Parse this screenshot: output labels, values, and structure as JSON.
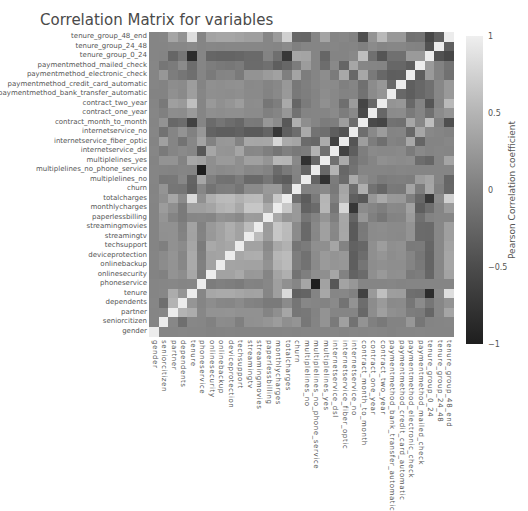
{
  "chart_data": {
    "type": "heatmap",
    "title": "Correlation Matrix for variables",
    "xlabel": "",
    "ylabel": "",
    "colorbar": {
      "label": "Pearson Correlation coefficient",
      "ticks": [
        "1",
        "0.5",
        "0",
        "−0.5",
        "−1"
      ],
      "range": [
        -1,
        1
      ],
      "colormap": "grayscale (light = +1, dark = -1)"
    },
    "grid": false,
    "legend_position": "right",
    "variables": [
      "gender",
      "seniorcitizen",
      "partner",
      "dependents",
      "tenure",
      "phoneservice",
      "onlinesecurity",
      "onlinebackup",
      "deviceprotection",
      "techsupport",
      "streamingtv",
      "streamingmovies",
      "paperlessbilling",
      "monthlycharges",
      "totalcharges",
      "churn",
      "multiplelines_no",
      "multiplelines_no_phone_service",
      "multiplelines_yes",
      "internetservice_dsl",
      "internetservice_fiber_optic",
      "internetservice_no",
      "contract_month_to_month",
      "contract_one_year",
      "contract_two_year",
      "paymentmethod_bank_transfer_automatic",
      "paymentmethod_credit_card_automatic",
      "paymentmethod_electronic_check",
      "paymentmethod_mailed_check",
      "tenure_group_0_24",
      "tenure_group_24_48",
      "tenure_group_48_end"
    ],
    "x_tick_labels_order": "left-to-right, same as variables",
    "y_tick_labels_order": "bottom-to-top, same as variables",
    "matrix_note": "Approximate values estimated from grayscale shading; diagonal = 1",
    "values": [
      [
        1,
        0,
        0,
        0.01,
        0,
        0,
        -0.02,
        -0.01,
        0,
        -0.01,
        -0.01,
        -0.01,
        -0.01,
        -0.01,
        0,
        -0.01,
        0,
        0,
        -0.01,
        0.01,
        -0.01,
        0.01,
        0,
        0.01,
        0,
        -0.02,
        0,
        0,
        0.01,
        0,
        0,
        0
      ],
      [
        0,
        1,
        0.02,
        -0.21,
        0.02,
        0.01,
        -0.04,
        0.07,
        0.06,
        -0.06,
        0.11,
        0.12,
        0.16,
        0.22,
        0.1,
        0.15,
        -0.14,
        -0.01,
        0.14,
        -0.11,
        0.26,
        -0.18,
        0.14,
        -0.05,
        -0.12,
        -0.02,
        -0.02,
        0.17,
        -0.15,
        -0.01,
        0,
        0.01
      ],
      [
        0,
        0.02,
        1,
        0.45,
        0.38,
        0.02,
        0.14,
        0.14,
        0.15,
        0.12,
        0.12,
        0.12,
        -0.01,
        0.1,
        0.32,
        -0.15,
        -0.13,
        -0.02,
        0.14,
        0,
        0,
        0,
        -0.28,
        0.08,
        0.25,
        0.11,
        0.08,
        -0.08,
        -0.1,
        -0.3,
        0.02,
        0.31
      ],
      [
        0.01,
        -0.21,
        0.45,
        1,
        0.16,
        0,
        0.08,
        0.02,
        0.01,
        0.06,
        -0.02,
        -0.04,
        -0.11,
        -0.11,
        0.06,
        -0.16,
        0.02,
        0,
        -0.02,
        0.05,
        -0.17,
        0.14,
        -0.23,
        0.07,
        0.2,
        0.05,
        0.06,
        -0.15,
        0.06,
        -0.15,
        0.02,
        0.14
      ],
      [
        0,
        0.02,
        0.38,
        0.16,
        1,
        0.01,
        0.33,
        0.36,
        0.36,
        0.32,
        0.28,
        0.29,
        0.01,
        0.25,
        0.83,
        -0.35,
        -0.32,
        -0.01,
        0.33,
        0.01,
        0.02,
        -0.04,
        -0.65,
        0.2,
        0.56,
        0.24,
        0.23,
        -0.21,
        -0.23,
        -0.86,
        0.05,
        0.86
      ],
      [
        0,
        0.01,
        0.02,
        0,
        0.01,
        1,
        -0.09,
        -0.05,
        -0.07,
        -0.1,
        -0.02,
        -0.03,
        0.02,
        0.25,
        0.11,
        0.01,
        0.32,
        -1,
        0.28,
        -0.45,
        0.29,
        0.17,
        0,
        0,
        0,
        0.01,
        -0.01,
        0,
        0,
        0,
        0,
        0
      ],
      [
        -0.02,
        -0.04,
        0.14,
        0.08,
        0.33,
        -0.09,
        1,
        0.28,
        0.28,
        0.35,
        0.18,
        0.19,
        0,
        0.3,
        0.41,
        -0.17,
        -0.06,
        0.09,
        0.1,
        0.32,
        -0.03,
        -0.33,
        -0.25,
        0.1,
        0.19,
        0.1,
        0.11,
        -0.11,
        -0.08,
        -0.3,
        0.02,
        0.29
      ],
      [
        -0.01,
        0.07,
        0.14,
        0.02,
        0.36,
        -0.05,
        0.28,
        1,
        0.3,
        0.29,
        0.28,
        0.28,
        0.13,
        0.44,
        0.51,
        -0.08,
        -0.18,
        0.05,
        0.2,
        0.16,
        0.17,
        -0.38,
        -0.16,
        0.08,
        0.11,
        0.09,
        0.09,
        -0.01,
        -0.12,
        -0.32,
        0.01,
        0.32
      ],
      [
        0,
        0.06,
        0.15,
        0.01,
        0.36,
        -0.07,
        0.28,
        0.3,
        1,
        0.33,
        0.39,
        0.4,
        0.1,
        0.48,
        0.52,
        -0.07,
        -0.19,
        0.07,
        0.2,
        0.15,
        0.18,
        -0.38,
        -0.23,
        0.1,
        0.16,
        0.08,
        0.11,
        -0.0,
        -0.14,
        -0.32,
        0.02,
        0.32
      ],
      [
        -0.01,
        -0.06,
        0.12,
        0.06,
        0.32,
        -0.1,
        0.35,
        0.29,
        0.33,
        1,
        0.28,
        0.28,
        0.04,
        0.34,
        0.43,
        -0.16,
        -0.1,
        0.1,
        0.1,
        0.31,
        -0.02,
        -0.34,
        -0.29,
        0.1,
        0.23,
        0.1,
        0.12,
        -0.11,
        -0.1,
        -0.3,
        0.02,
        0.29
      ],
      [
        -0.01,
        0.11,
        0.12,
        -0.02,
        0.28,
        -0.02,
        0.18,
        0.28,
        0.39,
        0.28,
        1,
        0.53,
        0.22,
        0.63,
        0.51,
        0.06,
        -0.27,
        0.02,
        0.26,
        0.02,
        0.33,
        -0.42,
        -0.11,
        0.06,
        0.07,
        0.05,
        0.04,
        0.14,
        -0.25,
        -0.26,
        0.02,
        0.25
      ],
      [
        -0.01,
        0.12,
        0.12,
        -0.04,
        0.29,
        -0.03,
        0.19,
        0.28,
        0.4,
        0.28,
        0.53,
        1,
        0.21,
        0.63,
        0.52,
        0.06,
        -0.27,
        0.03,
        0.26,
        0.03,
        0.32,
        -0.42,
        -0.12,
        0.06,
        0.08,
        0.05,
        0.05,
        0.14,
        -0.25,
        -0.26,
        0.02,
        0.25
      ],
      [
        -0.01,
        0.16,
        -0.01,
        -0.11,
        0.01,
        0.02,
        0,
        0.13,
        0.1,
        0.04,
        0.22,
        0.21,
        1,
        0.35,
        0.16,
        0.19,
        -0.15,
        -0.02,
        0.16,
        -0.06,
        0.33,
        -0.32,
        0.17,
        -0.05,
        -0.15,
        -0.02,
        -0.01,
        0.21,
        -0.2,
        -0.02,
        0.01,
        0.01
      ],
      [
        -0.01,
        0.22,
        0.1,
        -0.11,
        0.25,
        0.25,
        0.3,
        0.44,
        0.48,
        0.34,
        0.63,
        0.63,
        0.35,
        1,
        0.65,
        0.19,
        -0.34,
        -0.25,
        0.49,
        -0.16,
        0.79,
        -0.76,
        0.06,
        0,
        -0.07,
        0.04,
        0.03,
        0.27,
        -0.38,
        -0.21,
        0,
        0.21
      ],
      [
        0,
        0.1,
        0.32,
        0.06,
        0.83,
        0.11,
        0.41,
        0.51,
        0.52,
        0.43,
        0.51,
        0.52,
        0.16,
        0.65,
        1,
        -0.2,
        -0.4,
        -0.11,
        0.47,
        -0.05,
        0.36,
        -0.37,
        -0.44,
        0.17,
        0.35,
        0.19,
        0.18,
        -0.06,
        -0.29,
        -0.75,
        0.06,
        0.73
      ],
      [
        -0.01,
        0.15,
        -0.15,
        -0.16,
        -0.35,
        0.01,
        -0.17,
        -0.08,
        -0.07,
        -0.16,
        0.06,
        0.06,
        0.19,
        0.19,
        -0.2,
        1,
        -0.03,
        -0.01,
        0.04,
        -0.12,
        0.31,
        -0.23,
        0.41,
        -0.18,
        -0.3,
        -0.12,
        -0.13,
        0.3,
        -0.09,
        0.32,
        -0.05,
        -0.29
      ],
      [
        0,
        -0.14,
        -0.13,
        0.02,
        -0.32,
        0.32,
        -0.06,
        -0.18,
        -0.19,
        -0.1,
        -0.27,
        -0.27,
        -0.15,
        -0.34,
        -0.4,
        -0.03,
        1,
        -0.32,
        -0.82,
        -0.09,
        -0.25,
        0.36,
        0.09,
        -0.01,
        -0.1,
        -0.07,
        -0.06,
        -0.08,
        0.22,
        0.3,
        0,
        -0.3
      ],
      [
        0,
        -0.01,
        -0.02,
        0,
        -0.01,
        -1,
        0.09,
        0.05,
        0.07,
        0.1,
        0.02,
        0.03,
        -0.02,
        -0.25,
        -0.11,
        -0.01,
        -0.32,
        1,
        -0.28,
        0.45,
        -0.29,
        -0.17,
        0,
        0,
        0,
        -0.01,
        0.01,
        0,
        0,
        0,
        0,
        0
      ],
      [
        -0.01,
        0.14,
        0.14,
        -0.02,
        0.33,
        0.28,
        0.1,
        0.2,
        0.2,
        0.1,
        0.26,
        0.26,
        0.16,
        0.49,
        0.47,
        0.04,
        -0.82,
        -0.28,
        1,
        -0.2,
        0.37,
        -0.21,
        -0.09,
        0,
        0.11,
        0.08,
        0.06,
        0.08,
        -0.23,
        -0.3,
        0,
        0.3
      ],
      [
        0.01,
        -0.11,
        0,
        0.05,
        0.01,
        -0.45,
        0.32,
        0.16,
        0.15,
        0.31,
        0.02,
        0.03,
        -0.06,
        -0.16,
        -0.05,
        -0.12,
        -0.09,
        0.45,
        -0.2,
        1,
        -0.64,
        -0.38,
        -0.07,
        0.05,
        0.03,
        0.03,
        0.05,
        -0.1,
        0.04,
        -0.01,
        0.01,
        0
      ],
      [
        -0.01,
        0.26,
        0,
        -0.17,
        0.02,
        0.29,
        -0.03,
        0.17,
        0.18,
        -0.02,
        0.33,
        0.32,
        0.33,
        0.79,
        0.36,
        0.31,
        -0.25,
        -0.29,
        0.37,
        -0.64,
        1,
        -0.47,
        0.24,
        -0.08,
        -0.21,
        -0.02,
        -0.05,
        0.34,
        -0.31,
        -0.01,
        -0.01,
        0.02
      ],
      [
        0.01,
        -0.18,
        0,
        0.14,
        -0.04,
        0.17,
        -0.33,
        -0.38,
        -0.38,
        -0.34,
        -0.42,
        -0.42,
        -0.32,
        -0.76,
        -0.37,
        -0.23,
        0.36,
        -0.17,
        -0.21,
        -0.38,
        -0.47,
        1,
        -0.22,
        0.04,
        0.22,
        -0.01,
        0.0,
        -0.28,
        0.32,
        0.03,
        0,
        -0.03
      ],
      [
        0,
        0.14,
        -0.28,
        -0.23,
        -0.65,
        0,
        -0.25,
        -0.16,
        -0.23,
        -0.29,
        -0.11,
        -0.12,
        0.17,
        0.06,
        -0.44,
        0.41,
        0.09,
        0,
        -0.09,
        -0.07,
        0.24,
        -0.22,
        1,
        -0.57,
        -0.62,
        -0.18,
        -0.2,
        0.33,
        0.01,
        0.55,
        -0.05,
        -0.52
      ],
      [
        0.01,
        -0.05,
        0.08,
        0.07,
        0.2,
        0,
        0.1,
        0.08,
        0.1,
        0.1,
        0.06,
        0.06,
        -0.05,
        0,
        0.17,
        -0.18,
        -0.01,
        0,
        0,
        0.05,
        -0.08,
        0.04,
        -0.57,
        1,
        -0.29,
        0.06,
        0.07,
        -0.11,
        0,
        -0.2,
        0.06,
        0.15
      ],
      [
        0,
        -0.12,
        0.25,
        0.2,
        0.56,
        0,
        0.19,
        0.11,
        0.16,
        0.23,
        0.07,
        0.08,
        -0.15,
        -0.07,
        0.35,
        -0.3,
        -0.1,
        0,
        0.11,
        0.03,
        -0.21,
        0.22,
        -0.62,
        -0.29,
        1,
        0.15,
        0.17,
        -0.28,
        -0.01,
        -0.47,
        0,
        0.5
      ],
      [
        -0.02,
        -0.02,
        0.11,
        0.05,
        0.24,
        0.01,
        0.1,
        0.09,
        0.08,
        0.1,
        0.05,
        0.05,
        -0.02,
        0.04,
        0.19,
        -0.12,
        -0.07,
        -0.01,
        0.08,
        0.03,
        -0.02,
        -0.01,
        -0.18,
        0.06,
        0.15,
        1,
        -0.28,
        -0.38,
        -0.29,
        -0.2,
        0.02,
        0.19
      ],
      [
        0,
        -0.02,
        0.08,
        0.06,
        0.23,
        -0.01,
        0.11,
        0.09,
        0.11,
        0.12,
        0.04,
        0.05,
        -0.01,
        0.03,
        0.18,
        -0.13,
        -0.06,
        0.01,
        0.06,
        0.05,
        -0.05,
        0,
        -0.2,
        0.07,
        0.17,
        -0.28,
        1,
        -0.37,
        -0.29,
        -0.2,
        0.02,
        0.19
      ],
      [
        0,
        0.17,
        -0.08,
        -0.15,
        -0.21,
        0,
        -0.11,
        -0.01,
        0,
        -0.11,
        0.14,
        0.14,
        0.21,
        0.27,
        -0.06,
        0.3,
        -0.08,
        0,
        0.08,
        -0.1,
        0.34,
        -0.28,
        0.33,
        -0.11,
        -0.28,
        -0.38,
        -0.37,
        1,
        -0.39,
        0.2,
        -0.02,
        -0.19
      ],
      [
        0.01,
        -0.15,
        -0.1,
        0.06,
        -0.23,
        0,
        -0.08,
        -0.12,
        -0.14,
        -0.1,
        -0.25,
        -0.25,
        -0.2,
        -0.38,
        -0.29,
        -0.09,
        0.22,
        0,
        -0.23,
        0.04,
        -0.31,
        0.32,
        0.01,
        0,
        -0.01,
        -0.29,
        -0.29,
        -0.39,
        1,
        0.2,
        -0.03,
        -0.17
      ],
      [
        0,
        -0.01,
        -0.3,
        -0.15,
        -0.86,
        0,
        -0.3,
        -0.32,
        -0.32,
        -0.3,
        -0.26,
        -0.26,
        -0.02,
        -0.21,
        -0.75,
        0.32,
        0.3,
        0,
        -0.3,
        -0.01,
        -0.01,
        0.03,
        0.55,
        -0.2,
        -0.47,
        -0.2,
        -0.2,
        0.2,
        0.2,
        1,
        -0.5,
        -0.6
      ],
      [
        0,
        0,
        0.02,
        0.02,
        0.05,
        0,
        0.02,
        0.01,
        0.02,
        0.02,
        0.02,
        0.02,
        0.01,
        0,
        0.06,
        -0.05,
        0,
        0,
        0,
        0.01,
        -0.01,
        0,
        -0.05,
        0.06,
        0,
        0.02,
        0.02,
        -0.02,
        -0.03,
        -0.5,
        1,
        -0.36
      ],
      [
        0,
        0.01,
        0.31,
        0.14,
        0.86,
        0,
        0.29,
        0.32,
        0.32,
        0.29,
        0.25,
        0.25,
        0.01,
        0.21,
        0.73,
        -0.29,
        -0.3,
        0,
        0.3,
        0,
        0.02,
        -0.03,
        -0.52,
        0.15,
        0.5,
        0.19,
        0.19,
        -0.19,
        -0.17,
        -0.6,
        -0.36,
        1
      ]
    ]
  }
}
